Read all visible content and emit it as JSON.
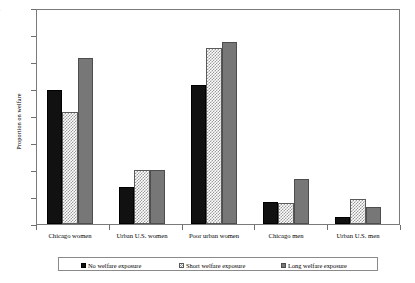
{
  "chart_data": {
    "type": "bar",
    "title": "",
    "xlabel": "",
    "ylabel": "Proportion on welfare",
    "ylim": [
      0,
      0.4
    ],
    "yticks": [
      "0",
      "0.05",
      "0.1",
      "0.15",
      "0.2",
      "0.25",
      "0.3",
      "0.35",
      "0.4"
    ],
    "ytick_values": [
      0,
      0.05,
      0.1,
      0.15,
      0.2,
      0.25,
      0.3,
      0.35,
      0.4
    ],
    "grid": false,
    "legend_position": "bottom",
    "categories": [
      "Chicago women",
      "Urban U.S. women",
      "Poor urban women",
      "Chicago men",
      "Urban U.S. men"
    ],
    "series": [
      {
        "name": "No welfare exposure",
        "color": "#111111",
        "values": [
          0.251,
          0.07,
          0.261,
          0.042,
          0.014
        ]
      },
      {
        "name": "Short welfare exposure",
        "color": "#cfcfcf",
        "values": [
          0.211,
          0.101,
          0.331,
          0.04,
          0.047
        ]
      },
      {
        "name": "Long welfare exposure",
        "color": "#777777",
        "values": [
          0.311,
          0.101,
          0.341,
          0.085,
          0.032
        ]
      }
    ]
  }
}
